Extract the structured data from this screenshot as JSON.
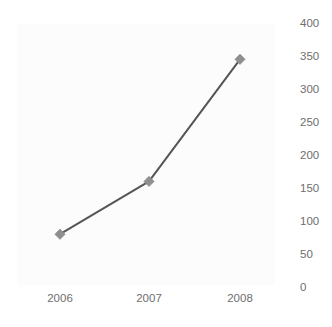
{
  "chart_data": {
    "type": "line",
    "title": "",
    "subtitle": "",
    "xlabel": "",
    "ylabel": "",
    "categories": [
      "2006",
      "2007",
      "2008"
    ],
    "values": [
      80,
      160,
      345
    ],
    "series": [
      {
        "name": "series-1",
        "values": [
          80,
          160,
          345
        ],
        "line_color": "#555555",
        "marker_color": "#8f8f8f",
        "marker_shape": "diamond"
      }
    ],
    "ylim": [
      0,
      400
    ],
    "yticks": [
      0,
      50,
      100,
      150,
      200,
      250,
      300,
      350,
      400
    ],
    "ytick_labels": [
      "0",
      "50",
      "100",
      "150",
      "200",
      "250",
      "300",
      "350",
      "400"
    ],
    "ytick_position": "right",
    "xtick_labels": [
      "2006",
      "2007",
      "2008"
    ],
    "grid": false,
    "legend": false,
    "legend_position": "none",
    "annotations": []
  },
  "axis": {
    "y_labels": [
      "400",
      "350",
      "300",
      "250",
      "200",
      "150",
      "100",
      "50",
      "0"
    ],
    "x_labels": [
      "2006",
      "2007",
      "2008"
    ]
  },
  "colors": {
    "line": "#555555",
    "marker": "#8f8f8f",
    "tick_text": "#6e6e6e",
    "plot_background": "#fcfcfc",
    "figure_background": "#ffffff"
  }
}
